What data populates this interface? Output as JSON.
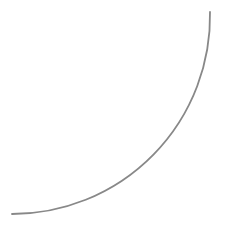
{
  "canvas": {
    "width": 227,
    "height": 229,
    "background": "#ffffff"
  },
  "shapes": [
    {
      "type": "arc",
      "name": "quarter-circle-arc",
      "start": [
        210,
        12
      ],
      "end": [
        12,
        214
      ],
      "center": [
        12,
        12
      ],
      "radius": 198,
      "stroke": "#888888",
      "stroke_width": 1.8
    }
  ]
}
